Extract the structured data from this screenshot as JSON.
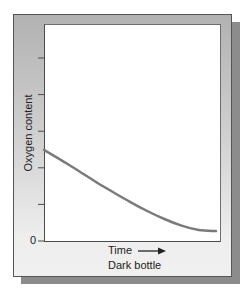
{
  "chart_data": {
    "type": "line",
    "title": "Dark bottle",
    "xlabel": "Time",
    "ylabel": "Oxygen content",
    "x_axis_arrow": "right-arrow",
    "y_tick_labels": [
      "0"
    ],
    "y_tick_count": 6,
    "ylim": [
      0,
      6
    ],
    "xlim": [
      0,
      1
    ],
    "grid": false,
    "legend": null,
    "series": [
      {
        "name": "Oxygen content (dark bottle)",
        "color": "#7a7a7a",
        "x": [
          0.0,
          0.1,
          0.2,
          0.3,
          0.4,
          0.5,
          0.6,
          0.7,
          0.8,
          0.9,
          1.0
        ],
        "y": [
          2.49,
          2.21,
          1.92,
          1.62,
          1.34,
          1.07,
          0.82,
          0.6,
          0.42,
          0.3,
          0.27
        ]
      }
    ],
    "annotations": [
      "Time →",
      "Dark bottle"
    ]
  },
  "labels": {
    "ylabel": "Oxygen content",
    "zero": "0",
    "xlabel": "Time",
    "subtitle": "Dark bottle"
  },
  "colors": {
    "panel_top": "#b2b2b2",
    "panel_bottom": "#f0f0f0",
    "shadow": "#8c8c8c",
    "curve": "#7a7a7a",
    "axis": "#4a4a4a"
  }
}
